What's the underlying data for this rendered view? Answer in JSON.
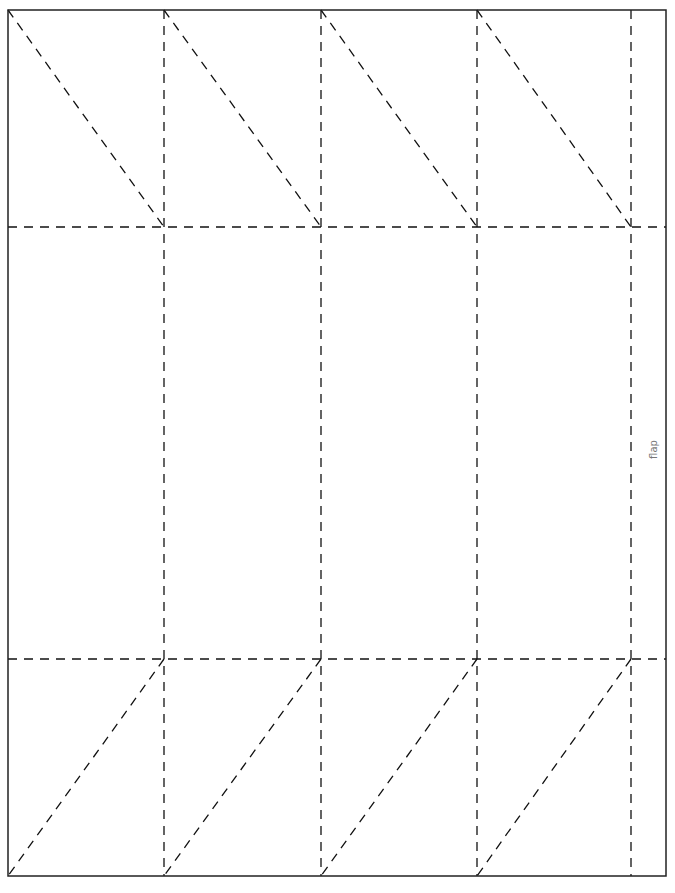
{
  "template": {
    "title": "Box net template",
    "flap_label": "flap",
    "colors": {
      "outline": "#222222",
      "fold": "#111111",
      "label": "#777777",
      "background": "#ffffff"
    },
    "outline": {
      "x": 8,
      "y": 10,
      "width": 658,
      "height": 866
    },
    "fold_lines": {
      "vertical_x": [
        164,
        321,
        477,
        631
      ],
      "horizontal_y": [
        227,
        659
      ]
    },
    "panels": [
      {
        "index": 1,
        "x0": 8,
        "x1": 164
      },
      {
        "index": 2,
        "x0": 164,
        "x1": 321
      },
      {
        "index": 3,
        "x0": 321,
        "x1": 477
      },
      {
        "index": 4,
        "x0": 477,
        "x1": 631
      },
      {
        "index": 5,
        "x0": 631,
        "x1": 666,
        "name": "flap"
      }
    ],
    "top_diagonals": [
      {
        "x1": 8,
        "y1": 10,
        "x2": 164,
        "y2": 227
      },
      {
        "x1": 164,
        "y1": 10,
        "x2": 321,
        "y2": 227
      },
      {
        "x1": 321,
        "y1": 10,
        "x2": 477,
        "y2": 227
      },
      {
        "x1": 477,
        "y1": 10,
        "x2": 631,
        "y2": 227
      }
    ],
    "bottom_diagonals": [
      {
        "x1": 164,
        "y1": 659,
        "x2": 8,
        "y2": 876
      },
      {
        "x1": 321,
        "y1": 659,
        "x2": 164,
        "y2": 876
      },
      {
        "x1": 477,
        "y1": 659,
        "x2": 321,
        "y2": 876
      },
      {
        "x1": 631,
        "y1": 659,
        "x2": 477,
        "y2": 876
      }
    ]
  }
}
